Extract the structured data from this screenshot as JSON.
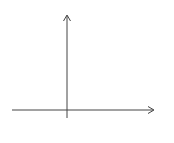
{
  "figure": {
    "label": "(D)",
    "axes": {
      "x_label": "x",
      "y_label": "y",
      "origin_label": "o",
      "x_tick_label": "1",
      "y_tick_label": "1"
    },
    "grid": {
      "x_range": [
        -5,
        7.8
      ],
      "y_range": [
        -0.7,
        8
      ],
      "cell": 1
    }
  },
  "chart_data": {
    "type": "line",
    "xlabel": "x",
    "ylabel": "y",
    "grid": true,
    "series": [
      {
        "name": "graph",
        "points": [
          [
            -5,
            5
          ],
          [
            -2,
            5
          ],
          [
            0,
            3
          ],
          [
            5,
            8
          ]
        ]
      }
    ],
    "open_points": [
      [
        -3,
        0
      ],
      [
        0,
        0
      ],
      [
        3,
        0
      ],
      [
        0,
        3
      ]
    ],
    "tick_labels": {
      "x": [
        "1"
      ],
      "y": [
        "1"
      ],
      "origin": "o"
    }
  },
  "colors": {
    "grid": "#c8c8c8",
    "axis": "#444444",
    "curve": "#333333",
    "point_fill": "#b0b0b0"
  }
}
